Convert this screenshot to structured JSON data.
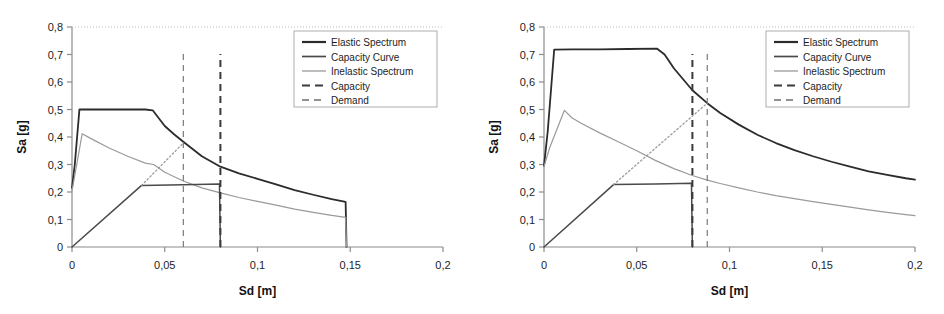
{
  "figure": {
    "background": "#ffffff",
    "panel_count": 2
  },
  "style": {
    "elastic_color": "#2b2b2b",
    "capacity_color": "#4a4a4a",
    "inelastic_color": "#9a9a9a",
    "capacity_line_color": "#3a3a3a",
    "demand_line_color": "#6e6e6e",
    "radial_dotted_color": "#9a9a9a",
    "axis_color": "#8c8c8c",
    "frame_top_color": "#bdbdbd"
  },
  "legend": {
    "position": "top-right",
    "entries": [
      {
        "label": "Elastic Spectrum",
        "style": "solid",
        "weight": "bold",
        "color": "#2b2b2b"
      },
      {
        "label": "Capacity Curve",
        "style": "solid",
        "weight": "medium",
        "color": "#4a4a4a"
      },
      {
        "label": "Inelastic Spectrum",
        "style": "solid",
        "weight": "thin",
        "color": "#9a9a9a"
      },
      {
        "label": "Capacity",
        "style": "dashed",
        "weight": "bold",
        "color": "#3a3a3a"
      },
      {
        "label": "Demand",
        "style": "dashed",
        "weight": "thin",
        "color": "#6e6e6e"
      }
    ]
  },
  "chart_data": [
    {
      "id": "left-panel",
      "type": "line",
      "title": "",
      "xlabel": "Sd [m]",
      "ylabel": "Sa [g]",
      "xlim": [
        0,
        0.2
      ],
      "ylim": [
        0,
        0.8
      ],
      "xticks": [
        0,
        0.05,
        0.1,
        0.15,
        0.2
      ],
      "xticklabels": [
        "0",
        "0,05",
        "0,1",
        "0,15",
        "0,2"
      ],
      "yticks": [
        0,
        0.1,
        0.2,
        0.3,
        0.4,
        0.5,
        0.6,
        0.7,
        0.8
      ],
      "yticklabels": [
        "0",
        "0,1",
        "0,2",
        "0,3",
        "0,4",
        "0,5",
        "0,6",
        "0,7",
        "0,8"
      ],
      "grid": false,
      "series": [
        {
          "name": "Elastic Spectrum",
          "style": "solid",
          "color": "#2b2b2b",
          "points": [
            [
              0.0,
              0.215
            ],
            [
              0.0015,
              0.3
            ],
            [
              0.004,
              0.5
            ],
            [
              0.01,
              0.5
            ],
            [
              0.02,
              0.5
            ],
            [
              0.03,
              0.5
            ],
            [
              0.0395,
              0.5
            ],
            [
              0.0435,
              0.497
            ],
            [
              0.05,
              0.44
            ],
            [
              0.055,
              0.41
            ],
            [
              0.06,
              0.383
            ],
            [
              0.07,
              0.33
            ],
            [
              0.08,
              0.292
            ],
            [
              0.09,
              0.268
            ],
            [
              0.1,
              0.248
            ],
            [
              0.11,
              0.228
            ],
            [
              0.12,
              0.207
            ],
            [
              0.13,
              0.19
            ],
            [
              0.14,
              0.174
            ],
            [
              0.1475,
              0.164
            ],
            [
              0.148,
              0.0
            ]
          ]
        },
        {
          "name": "Inelastic Spectrum",
          "style": "solid",
          "color": "#9a9a9a",
          "points": [
            [
              0.0,
              0.205
            ],
            [
              0.0015,
              0.26
            ],
            [
              0.0055,
              0.412
            ],
            [
              0.01,
              0.395
            ],
            [
              0.02,
              0.36
            ],
            [
              0.03,
              0.33
            ],
            [
              0.0395,
              0.305
            ],
            [
              0.044,
              0.3
            ],
            [
              0.05,
              0.272
            ],
            [
              0.06,
              0.24
            ],
            [
              0.07,
              0.215
            ],
            [
              0.08,
              0.197
            ],
            [
              0.09,
              0.18
            ],
            [
              0.1,
              0.166
            ],
            [
              0.11,
              0.152
            ],
            [
              0.12,
              0.138
            ],
            [
              0.13,
              0.126
            ],
            [
              0.14,
              0.115
            ],
            [
              0.1475,
              0.108
            ],
            [
              0.148,
              0.0
            ]
          ]
        },
        {
          "name": "Capacity Curve",
          "style": "solid",
          "color": "#4a4a4a",
          "points": [
            [
              0.0,
              0.0
            ],
            [
              0.0375,
              0.224
            ],
            [
              0.06,
              0.226
            ],
            [
              0.0795,
              0.229
            ],
            [
              0.08,
              0.0
            ]
          ]
        },
        {
          "name": "Radial line",
          "style": "dotted",
          "color": "#9a9a9a",
          "points": [
            [
              0.0375,
              0.224
            ],
            [
              0.06,
              0.378
            ]
          ]
        }
      ],
      "vlines": [
        {
          "name": "Demand",
          "x": 0.06,
          "style": "dashed",
          "weight": "thin",
          "color": "#6e6e6e"
        },
        {
          "name": "Capacity",
          "x": 0.08,
          "style": "dashed",
          "weight": "bold",
          "color": "#3a3a3a"
        }
      ],
      "annotations": {
        "elastic_plateau": 0.5,
        "inelastic_peak": 0.412,
        "capacity_yield": 0.224,
        "performance_point_sd": 0.06,
        "capacity_limit_sd": 0.08
      }
    },
    {
      "id": "right-panel",
      "type": "line",
      "title": "",
      "xlabel": "Sd [m]",
      "ylabel": "Sa [g]",
      "xlim": [
        0,
        0.2
      ],
      "ylim": [
        0,
        0.8
      ],
      "xticks": [
        0,
        0.05,
        0.1,
        0.15,
        0.2
      ],
      "xticklabels": [
        "0",
        "0,05",
        "0,1",
        "0,15",
        "0,2"
      ],
      "yticks": [
        0,
        0.1,
        0.2,
        0.3,
        0.4,
        0.5,
        0.6,
        0.7,
        0.8
      ],
      "yticklabels": [
        "0",
        "0,1",
        "0,2",
        "0,3",
        "0,4",
        "0,5",
        "0,6",
        "0,7",
        "0,8"
      ],
      "grid": false,
      "series": [
        {
          "name": "Elastic Spectrum",
          "style": "solid",
          "color": "#2b2b2b",
          "points": [
            [
              0.0,
              0.295
            ],
            [
              0.002,
              0.42
            ],
            [
              0.0055,
              0.718
            ],
            [
              0.015,
              0.719
            ],
            [
              0.03,
              0.719
            ],
            [
              0.045,
              0.72
            ],
            [
              0.061,
              0.721
            ],
            [
              0.065,
              0.7
            ],
            [
              0.07,
              0.65
            ],
            [
              0.08,
              0.57
            ],
            [
              0.088,
              0.523
            ],
            [
              0.095,
              0.487
            ],
            [
              0.105,
              0.445
            ],
            [
              0.115,
              0.408
            ],
            [
              0.125,
              0.378
            ],
            [
              0.135,
              0.352
            ],
            [
              0.145,
              0.33
            ],
            [
              0.155,
              0.31
            ],
            [
              0.165,
              0.292
            ],
            [
              0.175,
              0.275
            ],
            [
              0.185,
              0.262
            ],
            [
              0.195,
              0.25
            ],
            [
              0.2,
              0.245
            ]
          ]
        },
        {
          "name": "Inelastic Spectrum",
          "style": "solid",
          "color": "#9a9a9a",
          "points": [
            [
              0.0,
              0.292
            ],
            [
              0.003,
              0.36
            ],
            [
              0.011,
              0.497
            ],
            [
              0.015,
              0.47
            ],
            [
              0.02,
              0.45
            ],
            [
              0.03,
              0.415
            ],
            [
              0.04,
              0.383
            ],
            [
              0.05,
              0.35
            ],
            [
              0.06,
              0.315
            ],
            [
              0.07,
              0.285
            ],
            [
              0.08,
              0.26
            ],
            [
              0.088,
              0.243
            ],
            [
              0.095,
              0.231
            ],
            [
              0.105,
              0.215
            ],
            [
              0.115,
              0.2
            ],
            [
              0.125,
              0.187
            ],
            [
              0.135,
              0.176
            ],
            [
              0.145,
              0.165
            ],
            [
              0.155,
              0.155
            ],
            [
              0.165,
              0.145
            ],
            [
              0.175,
              0.135
            ],
            [
              0.185,
              0.126
            ],
            [
              0.195,
              0.118
            ],
            [
              0.2,
              0.114
            ]
          ]
        },
        {
          "name": "Capacity Curve",
          "style": "solid",
          "color": "#4a4a4a",
          "points": [
            [
              0.0,
              0.0
            ],
            [
              0.0375,
              0.227
            ],
            [
              0.06,
              0.229
            ],
            [
              0.0795,
              0.232
            ],
            [
              0.08,
              0.0
            ]
          ]
        },
        {
          "name": "Radial line",
          "style": "dotted",
          "color": "#9a9a9a",
          "points": [
            [
              0.0375,
              0.227
            ],
            [
              0.088,
              0.523
            ]
          ]
        }
      ],
      "vlines": [
        {
          "name": "Capacity",
          "x": 0.08,
          "style": "dashed",
          "weight": "bold",
          "color": "#3a3a3a"
        },
        {
          "name": "Demand",
          "x": 0.088,
          "style": "dashed",
          "weight": "thin",
          "color": "#6e6e6e"
        }
      ],
      "annotations": {
        "elastic_plateau": 0.72,
        "inelastic_peak": 0.497,
        "capacity_yield": 0.227,
        "capacity_limit_sd": 0.08,
        "performance_point_sd": 0.088
      }
    }
  ]
}
